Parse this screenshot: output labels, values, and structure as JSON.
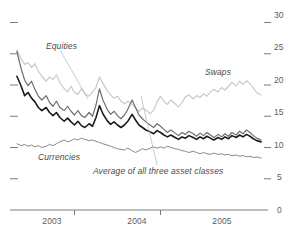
{
  "chart_data": {
    "type": "line",
    "title": "",
    "subtitle": "",
    "xlabel": "",
    "ylabel": "",
    "xlim": [
      2002.75,
      2005.75
    ],
    "ylim": [
      0,
      32
    ],
    "yticks": [
      0,
      5,
      10,
      15,
      20,
      25,
      30
    ],
    "ytick_labels": [
      "0",
      "5",
      "10",
      "15",
      "20",
      "25",
      "30"
    ],
    "xticks": [
      2003,
      2004,
      2005
    ],
    "xtick_labels": [
      "2003",
      "2004",
      "2005"
    ],
    "grid": false,
    "legend_position": "inline-annotations",
    "annotations": [
      {
        "text": "Equities",
        "x": 2003.15,
        "y": 24.3
      },
      {
        "text": "Swaps",
        "x": 2004.95,
        "y": 21.0
      },
      {
        "text": "Currencies",
        "x": 2003.1,
        "y": 8.6
      },
      {
        "text": "Average of all three asset classes",
        "x": 2003.75,
        "y": 6.6
      }
    ],
    "series": [
      {
        "name": "Equities",
        "color": "#c9c9c9",
        "width": 1.2,
        "x": [
          2002.83,
          2002.88,
          2002.92,
          2002.96,
          2003.0,
          2003.04,
          2003.08,
          2003.12,
          2003.17,
          2003.21,
          2003.25,
          2003.29,
          2003.33,
          2003.38,
          2003.42,
          2003.46,
          2003.5,
          2003.54,
          2003.58,
          2003.62,
          2003.67,
          2003.71,
          2003.75,
          2003.79,
          2003.83,
          2003.88,
          2003.92,
          2003.96,
          2004.0,
          2004.04,
          2004.08,
          2004.12,
          2004.17,
          2004.21,
          2004.25,
          2004.29,
          2004.33,
          2004.38,
          2004.42,
          2004.46,
          2004.5,
          2004.54,
          2004.58,
          2004.62,
          2004.67,
          2004.71,
          2004.75,
          2004.79,
          2004.83,
          2004.88,
          2004.92,
          2004.96,
          2005.0,
          2005.04,
          2005.08,
          2005.12,
          2005.17,
          2005.21,
          2005.25,
          2005.29,
          2005.33,
          2005.38,
          2005.42,
          2005.46,
          2005.5,
          2005.54,
          2005.58,
          2005.62,
          2005.67
        ],
        "y": [
          25.6,
          24.2,
          23.3,
          23.6,
          22.8,
          23.4,
          22.2,
          21.4,
          20.6,
          21.3,
          20.9,
          21.6,
          20.4,
          19.4,
          18.9,
          19.8,
          18.8,
          18.5,
          19.4,
          18.6,
          18.2,
          18.9,
          19.6,
          21.3,
          20.3,
          19.1,
          18.4,
          17.9,
          18.2,
          17.4,
          17.0,
          17.4,
          16.9,
          16.3,
          15.8,
          16.3,
          16.0,
          15.4,
          15.9,
          17.3,
          18.2,
          17.4,
          16.9,
          17.6,
          17.0,
          16.5,
          17.2,
          18.1,
          18.4,
          17.8,
          18.3,
          18.0,
          18.6,
          18.2,
          18.9,
          19.3,
          18.9,
          19.6,
          19.2,
          19.8,
          20.4,
          19.9,
          20.6,
          20.1,
          20.7,
          20.2,
          19.5,
          18.8,
          18.4
        ]
      },
      {
        "name": "Swaps",
        "color": "#6f6f6f",
        "width": 1.2,
        "x": [
          2002.83,
          2002.88,
          2002.92,
          2002.96,
          2003.0,
          2003.04,
          2003.08,
          2003.12,
          2003.17,
          2003.21,
          2003.25,
          2003.29,
          2003.33,
          2003.38,
          2003.42,
          2003.46,
          2003.5,
          2003.54,
          2003.58,
          2003.62,
          2003.67,
          2003.71,
          2003.75,
          2003.79,
          2003.83,
          2003.88,
          2003.92,
          2003.96,
          2004.0,
          2004.04,
          2004.08,
          2004.12,
          2004.17,
          2004.21,
          2004.25,
          2004.29,
          2004.33,
          2004.38,
          2004.42,
          2004.46,
          2004.5,
          2004.54,
          2004.58,
          2004.62,
          2004.67,
          2004.71,
          2004.75,
          2004.79,
          2004.83,
          2004.88,
          2004.92,
          2004.96,
          2005.0,
          2005.04,
          2005.08,
          2005.12,
          2005.17,
          2005.21,
          2005.25,
          2005.29,
          2005.33,
          2005.38,
          2005.42,
          2005.46,
          2005.5,
          2005.54,
          2005.58,
          2005.62,
          2005.67
        ],
        "y": [
          25.4,
          22.6,
          20.8,
          19.9,
          20.6,
          19.3,
          18.2,
          17.6,
          18.3,
          17.2,
          16.6,
          17.4,
          16.4,
          15.9,
          16.6,
          15.8,
          15.2,
          15.9,
          15.1,
          14.8,
          15.6,
          15.0,
          16.8,
          19.4,
          17.6,
          16.1,
          15.3,
          15.8,
          15.1,
          14.6,
          15.2,
          16.1,
          17.6,
          16.4,
          15.2,
          14.6,
          14.1,
          13.6,
          13.2,
          13.8,
          13.4,
          12.9,
          12.4,
          12.8,
          12.3,
          11.9,
          12.4,
          12.1,
          12.6,
          12.2,
          11.8,
          12.3,
          11.9,
          12.4,
          12.0,
          11.6,
          12.1,
          11.7,
          12.2,
          11.8,
          12.4,
          12.0,
          12.6,
          12.2,
          12.8,
          12.4,
          11.9,
          11.5,
          11.2
        ]
      },
      {
        "name": "Average of all three asset classes",
        "color": "#1c1c1c",
        "width": 1.6,
        "x": [
          2002.83,
          2002.88,
          2002.92,
          2002.96,
          2003.0,
          2003.04,
          2003.08,
          2003.12,
          2003.17,
          2003.21,
          2003.25,
          2003.29,
          2003.33,
          2003.38,
          2003.42,
          2003.46,
          2003.5,
          2003.54,
          2003.58,
          2003.62,
          2003.67,
          2003.71,
          2003.75,
          2003.79,
          2003.83,
          2003.88,
          2003.92,
          2003.96,
          2004.0,
          2004.04,
          2004.08,
          2004.12,
          2004.17,
          2004.21,
          2004.25,
          2004.29,
          2004.33,
          2004.38,
          2004.42,
          2004.46,
          2004.5,
          2004.54,
          2004.58,
          2004.62,
          2004.67,
          2004.71,
          2004.75,
          2004.79,
          2004.83,
          2004.88,
          2004.92,
          2004.96,
          2005.0,
          2005.04,
          2005.08,
          2005.12,
          2005.17,
          2005.21,
          2005.25,
          2005.29,
          2005.33,
          2005.38,
          2005.42,
          2005.46,
          2005.5,
          2005.54,
          2005.58,
          2005.62,
          2005.67
        ],
        "y": [
          21.4,
          19.8,
          18.3,
          18.8,
          17.9,
          17.3,
          16.4,
          15.9,
          16.4,
          15.6,
          15.1,
          15.6,
          14.8,
          14.2,
          14.7,
          14.1,
          13.6,
          14.2,
          13.5,
          13.2,
          13.8,
          13.4,
          14.8,
          16.7,
          15.4,
          14.3,
          13.7,
          14.1,
          13.6,
          13.2,
          13.6,
          14.2,
          15.3,
          14.4,
          13.6,
          13.2,
          12.8,
          12.5,
          12.2,
          12.7,
          12.4,
          12.0,
          11.7,
          12.0,
          11.6,
          11.3,
          11.7,
          11.5,
          11.9,
          11.6,
          11.3,
          11.7,
          11.4,
          11.8,
          11.5,
          11.2,
          11.6,
          11.3,
          11.7,
          11.4,
          11.9,
          11.6,
          12.0,
          11.7,
          12.1,
          11.8,
          11.4,
          11.1,
          10.9
        ]
      },
      {
        "name": "Currencies",
        "color": "#8a8a8a",
        "width": 1.0,
        "x": [
          2002.83,
          2002.88,
          2002.92,
          2002.96,
          2003.0,
          2003.04,
          2003.08,
          2003.12,
          2003.17,
          2003.21,
          2003.25,
          2003.29,
          2003.33,
          2003.38,
          2003.42,
          2003.46,
          2003.5,
          2003.54,
          2003.58,
          2003.62,
          2003.67,
          2003.71,
          2003.75,
          2003.79,
          2003.83,
          2003.88,
          2003.92,
          2003.96,
          2004.0,
          2004.04,
          2004.08,
          2004.12,
          2004.17,
          2004.21,
          2004.25,
          2004.29,
          2004.33,
          2004.38,
          2004.42,
          2004.46,
          2004.5,
          2004.54,
          2004.58,
          2004.62,
          2004.67,
          2004.71,
          2004.75,
          2004.79,
          2004.83,
          2004.88,
          2004.92,
          2004.96,
          2005.0,
          2005.04,
          2005.08,
          2005.12,
          2005.17,
          2005.21,
          2005.25,
          2005.29,
          2005.33,
          2005.38,
          2005.42,
          2005.46,
          2005.5,
          2005.54,
          2005.58,
          2005.62,
          2005.67
        ],
        "y": [
          10.6,
          10.3,
          10.5,
          10.2,
          10.4,
          10.1,
          10.3,
          10.0,
          10.2,
          10.5,
          10.3,
          10.6,
          10.9,
          11.2,
          10.9,
          11.1,
          11.4,
          11.2,
          11.5,
          11.3,
          11.1,
          11.2,
          11.0,
          10.8,
          10.6,
          10.4,
          10.2,
          10.0,
          9.8,
          9.7,
          9.6,
          9.9,
          9.5,
          9.2,
          9.5,
          9.8,
          9.6,
          9.9,
          10.1,
          9.9,
          10.1,
          9.9,
          10.2,
          10.0,
          9.8,
          9.7,
          9.5,
          9.4,
          9.2,
          9.4,
          9.2,
          9.0,
          9.2,
          9.0,
          8.9,
          9.1,
          8.9,
          9.0,
          8.8,
          8.9,
          8.7,
          8.8,
          8.6,
          8.7,
          8.5,
          8.6,
          8.4,
          8.5,
          8.3
        ]
      }
    ]
  },
  "axis": {
    "y_labels": [
      "30",
      "25",
      "20",
      "15",
      "10",
      "5",
      "0"
    ],
    "x_labels": [
      "2003",
      "2004",
      "2005"
    ]
  },
  "labels": {
    "equities": "Equities",
    "swaps": "Swaps",
    "currencies": "Currencies",
    "average": "Average of all three asset classes"
  },
  "header": {
    "clipped_text": ""
  },
  "colors": {
    "equities": "#c9c9c9",
    "swaps": "#6f6f6f",
    "average": "#1c1c1c",
    "currencies": "#8a8a8a",
    "axis": "#6d6d6d",
    "text": "#4a4a4a"
  }
}
